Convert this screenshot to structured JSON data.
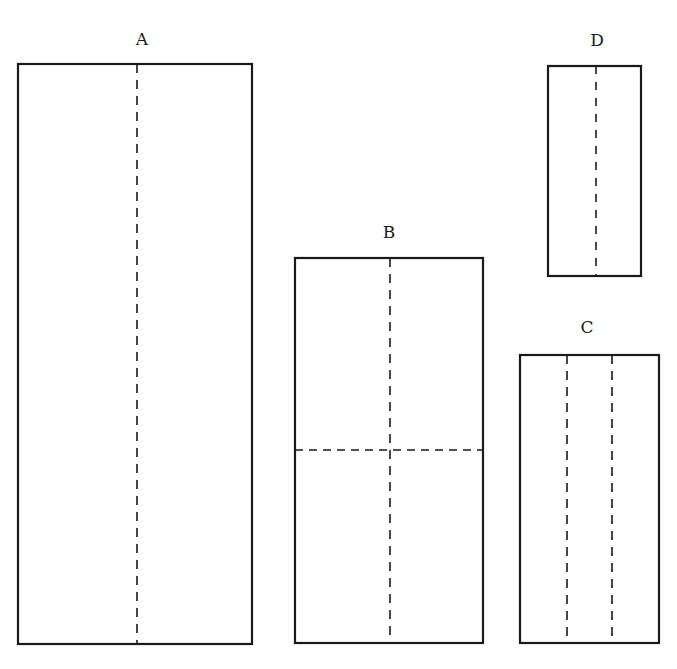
{
  "diagram": {
    "panels": [
      {
        "label": "A",
        "rect": {
          "x": 18,
          "y": 64,
          "w": 234,
          "h": 580
        },
        "label_pos": {
          "x": 142,
          "y": 45
        },
        "folds": [
          {
            "orientation": "vertical",
            "x1": 137,
            "y1": 64,
            "x2": 137,
            "y2": 644
          }
        ]
      },
      {
        "label": "B",
        "rect": {
          "x": 295,
          "y": 258,
          "w": 188,
          "h": 385
        },
        "label_pos": {
          "x": 389,
          "y": 238
        },
        "folds": [
          {
            "orientation": "vertical",
            "x1": 390,
            "y1": 258,
            "x2": 390,
            "y2": 643
          },
          {
            "orientation": "horizontal",
            "x1": 295,
            "y1": 450,
            "x2": 483,
            "y2": 450
          }
        ]
      },
      {
        "label": "C",
        "rect": {
          "x": 520,
          "y": 355,
          "w": 139,
          "h": 288
        },
        "label_pos": {
          "x": 587,
          "y": 333
        },
        "folds": [
          {
            "orientation": "vertical",
            "x1": 567,
            "y1": 355,
            "x2": 567,
            "y2": 643
          },
          {
            "orientation": "vertical",
            "x1": 612,
            "y1": 355,
            "x2": 612,
            "y2": 643
          }
        ]
      },
      {
        "label": "D",
        "rect": {
          "x": 548,
          "y": 66,
          "w": 93,
          "h": 210
        },
        "label_pos": {
          "x": 597,
          "y": 46
        },
        "folds": [
          {
            "orientation": "vertical",
            "x1": 596,
            "y1": 66,
            "x2": 596,
            "y2": 276
          }
        ]
      }
    ],
    "stroke_color": "#1a1a1a",
    "background": "#ffffff"
  }
}
